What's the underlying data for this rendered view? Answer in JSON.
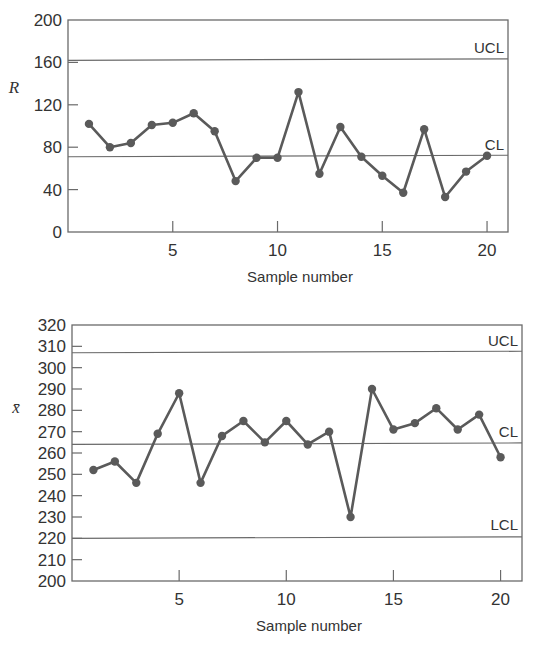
{
  "chart_data": [
    {
      "type": "line",
      "title": "",
      "ylabel": "R",
      "xlabel": "Sample number",
      "xlim": [
        0,
        21
      ],
      "ylim": [
        0,
        200
      ],
      "yticks": [
        0,
        40,
        80,
        120,
        160,
        200
      ],
      "xticks": [
        5,
        10,
        15,
        20
      ],
      "grid": false,
      "x": [
        1,
        2,
        3,
        4,
        5,
        6,
        7,
        8,
        9,
        10,
        11,
        12,
        13,
        14,
        15,
        16,
        17,
        18,
        19,
        20
      ],
      "series": [
        {
          "name": "R",
          "values": [
            102,
            80,
            84,
            101,
            103,
            112,
            95,
            48,
            70,
            70,
            132,
            55,
            99,
            71,
            53,
            37,
            97,
            33,
            57,
            72
          ]
        }
      ],
      "control_limits": [
        {
          "label": "UCL",
          "value": 162
        },
        {
          "label": "CL",
          "value": 71
        }
      ]
    },
    {
      "type": "line",
      "title": "",
      "ylabel": "x̄",
      "xlabel": "Sample number",
      "xlim": [
        0,
        21
      ],
      "ylim": [
        200,
        320
      ],
      "yticks": [
        200,
        210,
        220,
        230,
        240,
        250,
        260,
        270,
        280,
        290,
        300,
        310,
        320
      ],
      "xticks": [
        5,
        10,
        15,
        20
      ],
      "grid": false,
      "x": [
        1,
        2,
        3,
        4,
        5,
        6,
        7,
        8,
        9,
        10,
        11,
        12,
        13,
        14,
        15,
        16,
        17,
        18,
        19,
        20
      ],
      "series": [
        {
          "name": "x̄",
          "values": [
            252,
            256,
            246,
            269,
            288,
            246,
            268,
            275,
            265,
            275,
            264,
            270,
            230,
            290,
            271,
            274,
            281,
            271,
            278,
            258
          ]
        }
      ],
      "control_limits": [
        {
          "label": "UCL",
          "value": 307
        },
        {
          "label": "CL",
          "value": 264
        },
        {
          "label": "LCL",
          "value": 220
        }
      ]
    }
  ],
  "charts": {
    "top": {
      "ylabel": "R",
      "xlabel": "Sample number"
    },
    "bottom": {
      "ylabel": "x̄",
      "xlabel": "Sample number"
    }
  },
  "colors": {
    "line": "#5a5a5a",
    "axis": "#6a6a6a",
    "text": "#333333"
  }
}
